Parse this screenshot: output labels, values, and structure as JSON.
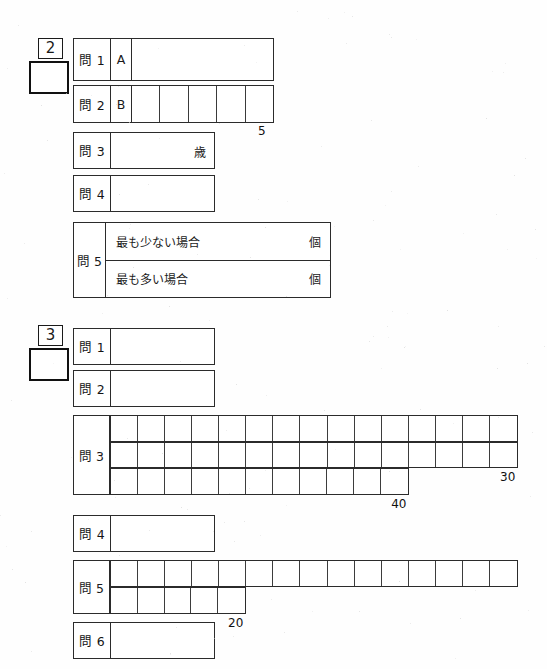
{
  "page": {
    "width": 547,
    "height": 669,
    "background": "#fefefe",
    "ink": "#2b2b2b"
  },
  "sections": [
    {
      "id": "section-2",
      "badge": "2",
      "score_value": "",
      "questions": [
        {
          "id": "s2-q1",
          "label": "問 1",
          "sub_label": "A",
          "value": "",
          "unit": "",
          "type": "open"
        },
        {
          "id": "s2-q2",
          "label": "問 2",
          "sub_label": "B",
          "value": "",
          "unit": "",
          "type": "cells",
          "cell_count": 5,
          "count_label": "5"
        },
        {
          "id": "s2-q3",
          "label": "問 3",
          "sub_label": "",
          "value": "",
          "unit": "歳",
          "type": "open"
        },
        {
          "id": "s2-q4",
          "label": "問 4",
          "sub_label": "",
          "value": "",
          "unit": "",
          "type": "open"
        },
        {
          "id": "s2-q5",
          "label": "問 5",
          "type": "dual",
          "rows": [
            {
              "text": "最も少ない場合",
              "value": "",
              "unit": "個"
            },
            {
              "text": "最も多い場合",
              "value": "",
              "unit": "個"
            }
          ]
        }
      ]
    },
    {
      "id": "section-3",
      "badge": "3",
      "score_value": "",
      "questions": [
        {
          "id": "s3-q1",
          "label": "問 1",
          "value": "",
          "type": "open"
        },
        {
          "id": "s3-q2",
          "label": "問 2",
          "value": "",
          "type": "open"
        },
        {
          "id": "s3-q3",
          "label": "問 3",
          "type": "grid",
          "grid_rows": [
            {
              "cells": 15,
              "value": ""
            },
            {
              "cells": 15,
              "value": ""
            },
            {
              "cells": 11,
              "value": ""
            }
          ],
          "count_labels": [
            {
              "text": "30",
              "row": 2
            },
            {
              "text": "40",
              "row": 3
            }
          ]
        },
        {
          "id": "s3-q4",
          "label": "問 4",
          "value": "",
          "type": "open"
        },
        {
          "id": "s3-q5",
          "label": "問 5",
          "type": "grid",
          "grid_rows": [
            {
              "cells": 15,
              "value": ""
            },
            {
              "cells": 5,
              "value": ""
            }
          ],
          "count_labels": [
            {
              "text": "20",
              "row": 2
            }
          ]
        },
        {
          "id": "s3-q6",
          "label": "問 6",
          "value": "",
          "type": "open"
        }
      ]
    }
  ]
}
